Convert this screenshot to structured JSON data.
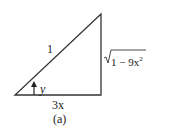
{
  "diagram": {
    "hypotenuse_label": "1",
    "opposite_label_radicand": "1 − 9x",
    "opposite_label_exponent": "2",
    "adjacent_label": "3x",
    "angle_label": "y",
    "caption": "(a)",
    "line_color": "#333333"
  }
}
